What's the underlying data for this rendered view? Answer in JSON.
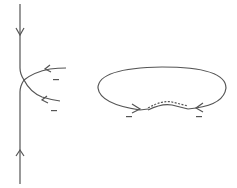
{
  "diagram": {
    "background": "#ffffff",
    "stroke_color": "#555555",
    "left_figure": {
      "description": "vertical line with two incoming curved branches meeting at a junction",
      "arrows": [
        "down-arrow-top",
        "up-arrow-bottom",
        "left-arrow-upper-branch",
        "left-arrow-lower-branch"
      ],
      "labels": [
        "−",
        "−"
      ]
    },
    "right_figure": {
      "description": "closed oval loop with dashed double segment at bottom and two inward arrows",
      "labels": [
        "−",
        "−"
      ]
    }
  }
}
